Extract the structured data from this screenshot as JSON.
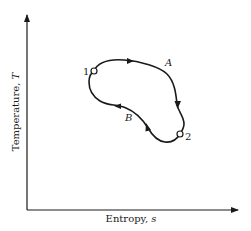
{
  "diagram": {
    "type": "T-s cycle diagram",
    "axes": {
      "x_label": "Entropy, ",
      "x_symbol": "s",
      "y_label": "Temperature, ",
      "y_symbol": "T"
    },
    "states": [
      {
        "id": "1",
        "label": "1"
      },
      {
        "id": "2",
        "label": "2"
      }
    ],
    "paths": [
      {
        "id": "A",
        "label": "A",
        "from": "1",
        "to": "2",
        "direction": "clockwise, upper path"
      },
      {
        "id": "B",
        "label": "B",
        "from": "2",
        "to": "1",
        "direction": "return, lower path"
      }
    ],
    "colors": {
      "line": "#1a1a1a",
      "background": "#ffffff"
    }
  }
}
